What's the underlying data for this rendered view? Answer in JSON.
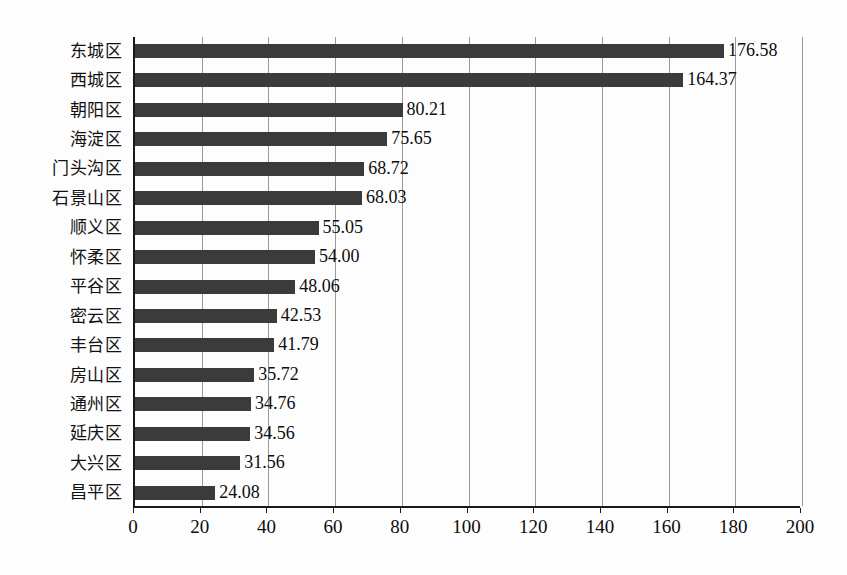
{
  "chart_data": {
    "type": "bar",
    "orientation": "horizontal",
    "title": "",
    "subtitle": "",
    "xlabel": "",
    "ylabel": "",
    "xlim": [
      0,
      200
    ],
    "ylim": null,
    "grid": true,
    "grid_axis": "x",
    "legend": false,
    "legend_position": "none",
    "categories": [
      "东城区",
      "西城区",
      "朝阳区",
      "海淀区",
      "门头沟区",
      "石景山区",
      "顺义区",
      "怀柔区",
      "平谷区",
      "密云区",
      "丰台区",
      "房山区",
      "通州区",
      "延庆区",
      "大兴区",
      "昌平区"
    ],
    "values": [
      176.58,
      164.37,
      80.21,
      75.65,
      68.72,
      68.03,
      55.05,
      54.0,
      48.06,
      42.53,
      41.79,
      35.72,
      34.76,
      34.56,
      31.56,
      24.08
    ],
    "value_labels": [
      "176.58",
      "164.37",
      "80.21",
      "75.65",
      "68.72",
      "68.03",
      "55.05",
      "54.00",
      "48.06",
      "42.53",
      "41.79",
      "35.72",
      "34.76",
      "34.56",
      "31.56",
      "24.08"
    ],
    "xticks": [
      0,
      20,
      40,
      60,
      80,
      100,
      120,
      140,
      160,
      180,
      200
    ],
    "xtick_labels": [
      "0",
      "20",
      "40",
      "60",
      "80",
      "100",
      "120",
      "140",
      "160",
      "180",
      "200"
    ],
    "series": [
      {
        "name": "",
        "color": "#3b3b3b",
        "values": [
          176.58,
          164.37,
          80.21,
          75.65,
          68.72,
          68.03,
          55.05,
          54.0,
          48.06,
          42.53,
          41.79,
          35.72,
          34.76,
          34.56,
          31.56,
          24.08
        ]
      }
    ],
    "colors": {
      "bar": "#3b3b3b",
      "axis": "#1a1a1a",
      "grid": "#9a9a9a",
      "background": "#fdfdfd",
      "text": "#0d0d0d"
    }
  }
}
